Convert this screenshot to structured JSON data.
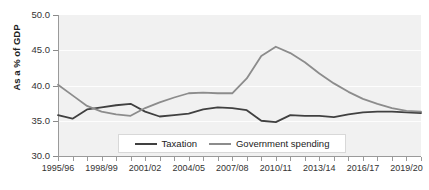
{
  "chart_data": {
    "type": "line",
    "title": "",
    "xlabel": "",
    "ylabel": "As a % of GDP",
    "ylim": [
      30.0,
      50.0
    ],
    "ytick_labels": [
      "50.0",
      "45.0",
      "40.0",
      "35.0",
      "30.0"
    ],
    "ytick_values": [
      50.0,
      45.0,
      40.0,
      35.0,
      30.0
    ],
    "grid": true,
    "legend_position": "bottom-center",
    "x": [
      "1995/96",
      "1996/97",
      "1997/98",
      "1998/99",
      "1999/00",
      "2000/01",
      "2001/02",
      "2002/03",
      "2003/04",
      "2004/05",
      "2005/06",
      "2006/07",
      "2007/08",
      "2008/09",
      "2009/10",
      "2010/11",
      "2011/12",
      "2012/13",
      "2013/14",
      "2014/15",
      "2015/16",
      "2016/17",
      "2017/18",
      "2018/19",
      "2019/20",
      "2020/21"
    ],
    "xtick_labels": [
      "1995/96",
      "1998/99",
      "2001/02",
      "2004/05",
      "2007/08",
      "2010/11",
      "2013/14",
      "2016/17",
      "2019/20"
    ],
    "series": [
      {
        "name": "Taxation",
        "color": "#404040",
        "values": [
          35.8,
          35.3,
          36.6,
          36.9,
          37.2,
          37.4,
          36.3,
          35.6,
          35.8,
          36.0,
          36.6,
          36.9,
          36.8,
          36.5,
          35.0,
          34.8,
          35.8,
          35.7,
          35.7,
          35.5,
          35.9,
          36.2,
          36.3,
          36.3,
          36.2,
          36.1
        ]
      },
      {
        "name": "Government spending",
        "color": "#8c8c8c",
        "values": [
          40.1,
          38.6,
          37.1,
          36.3,
          35.9,
          35.7,
          36.8,
          37.6,
          38.3,
          38.9,
          39.0,
          38.9,
          38.9,
          41.0,
          44.2,
          45.5,
          44.6,
          43.3,
          41.7,
          40.3,
          39.1,
          38.1,
          37.4,
          36.8,
          36.4,
          36.3
        ]
      }
    ]
  },
  "legend": {
    "entries": [
      {
        "label": "Taxation",
        "color": "#404040"
      },
      {
        "label": "Government spending",
        "color": "#8c8c8c"
      }
    ]
  }
}
